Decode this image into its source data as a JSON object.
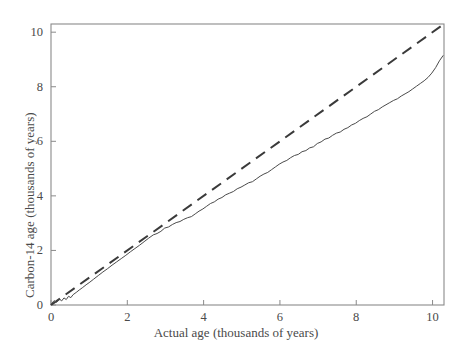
{
  "chart_data": {
    "type": "line",
    "title": "",
    "subtitle": "",
    "xlabel": "Actual age (thousands of years)",
    "ylabel": "Carbon-14 age (thousands of years)",
    "xlim": [
      0,
      10.3
    ],
    "ylim": [
      0,
      10.3
    ],
    "xticks": [
      0,
      2,
      4,
      6,
      8,
      10
    ],
    "yticks": [
      0,
      2,
      4,
      6,
      8,
      10
    ],
    "xtick_labels": [
      "0",
      "2",
      "4",
      "6",
      "8",
      "10"
    ],
    "ytick_labels": [
      "0",
      "2",
      "4",
      "6",
      "8",
      "10"
    ],
    "grid": false,
    "legend": "none",
    "frame": "full-box",
    "colors": {
      "calibration_curve": "#4a4a4a",
      "reference_line": "#3a3a3a",
      "axis": "#8a8a8a",
      "background": "#ffffff",
      "text": "#4a4a4a"
    },
    "series": [
      {
        "name": "Reference line (1:1, Carbon-14 age = actual age)",
        "style": "dashed",
        "linewidth": 2,
        "dash_pattern": [
          11,
          7
        ],
        "x": [
          0,
          10.3
        ],
        "values": [
          0,
          10.3
        ]
      },
      {
        "name": "Carbon-14 calibration curve",
        "style": "solid",
        "linewidth": 1,
        "x": [
          0.0,
          0.08,
          0.15,
          0.22,
          0.28,
          0.34,
          0.4,
          0.46,
          0.52,
          0.58,
          0.66,
          0.74,
          0.82,
          0.92,
          1.02,
          1.12,
          1.24,
          1.36,
          1.48,
          1.6,
          1.72,
          1.84,
          1.96,
          2.08,
          2.2,
          2.32,
          2.44,
          2.56,
          2.68,
          2.78,
          2.88,
          2.98,
          3.08,
          3.18,
          3.28,
          3.38,
          3.48,
          3.58,
          3.68,
          3.78,
          3.88,
          3.98,
          4.08,
          4.18,
          4.28,
          4.38,
          4.48,
          4.58,
          4.68,
          4.78,
          4.88,
          4.98,
          5.08,
          5.18,
          5.28,
          5.38,
          5.48,
          5.58,
          5.68,
          5.78,
          5.88,
          5.98,
          6.08,
          6.18,
          6.28,
          6.38,
          6.48,
          6.58,
          6.68,
          6.78,
          6.88,
          6.98,
          7.08,
          7.18,
          7.28,
          7.38,
          7.48,
          7.58,
          7.68,
          7.78,
          7.88,
          7.98,
          8.08,
          8.18,
          8.28,
          8.38,
          8.48,
          8.58,
          8.68,
          8.78,
          8.88,
          8.98,
          9.08,
          9.18,
          9.28,
          9.38,
          9.48,
          9.58,
          9.68,
          9.78,
          9.88,
          9.98,
          10.08,
          10.18,
          10.28
        ],
        "values": [
          0.02,
          0.16,
          0.1,
          0.22,
          0.15,
          0.26,
          0.2,
          0.32,
          0.27,
          0.38,
          0.46,
          0.55,
          0.63,
          0.74,
          0.84,
          0.95,
          1.08,
          1.21,
          1.33,
          1.46,
          1.58,
          1.7,
          1.82,
          1.95,
          2.07,
          2.19,
          2.32,
          2.45,
          2.57,
          2.62,
          2.7,
          2.82,
          2.86,
          2.95,
          3.02,
          3.06,
          3.14,
          3.2,
          3.24,
          3.34,
          3.44,
          3.52,
          3.62,
          3.72,
          3.78,
          3.88,
          3.94,
          4.04,
          4.1,
          4.16,
          4.26,
          4.32,
          4.4,
          4.48,
          4.52,
          4.62,
          4.72,
          4.8,
          4.86,
          4.96,
          5.06,
          5.16,
          5.24,
          5.3,
          5.4,
          5.48,
          5.52,
          5.62,
          5.66,
          5.76,
          5.8,
          5.92,
          5.98,
          6.08,
          6.12,
          6.22,
          6.3,
          6.34,
          6.44,
          6.5,
          6.6,
          6.66,
          6.76,
          6.84,
          6.9,
          7.0,
          7.1,
          7.16,
          7.26,
          7.34,
          7.42,
          7.5,
          7.56,
          7.66,
          7.74,
          7.82,
          7.92,
          8.02,
          8.12,
          8.22,
          8.34,
          8.5,
          8.7,
          8.95,
          9.15
        ]
      }
    ]
  }
}
